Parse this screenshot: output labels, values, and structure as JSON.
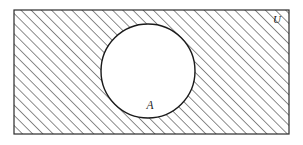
{
  "diagram": {
    "type": "venn-diagram",
    "canvas": {
      "width": 303,
      "height": 145,
      "background_color": "#ffffff"
    },
    "universe": {
      "name": "universal-set",
      "label": "U",
      "shape": "rectangle",
      "x": 14,
      "y": 10,
      "width": 275,
      "height": 124,
      "stroke_color": "#2b2b2b",
      "stroke_width": 1.2,
      "fill_color": "#ffffff",
      "hatched": true,
      "label_x": 277,
      "label_y": 23
    },
    "hatching": {
      "name": "diagonal-hatch",
      "angle_degrees": 45,
      "direction": "lower-left-to-upper-right",
      "spacing_px": 7.2,
      "line_width": 1.1,
      "color": "#2f2f2f"
    },
    "set_a": {
      "name": "set-a",
      "label": "A",
      "shape": "circle",
      "center_x": 148,
      "center_y": 71,
      "radius": 47,
      "stroke_color": "#1a1a1a",
      "stroke_width": 1.4,
      "fill_color": "#ffffff",
      "shaded": false,
      "label_x": 150,
      "label_y": 109
    }
  }
}
